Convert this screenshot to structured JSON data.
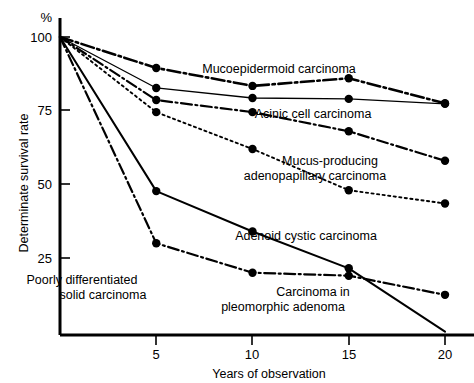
{
  "chart_data": {
    "type": "line",
    "title": "",
    "xlabel": "Years of observation",
    "ylabel": "Determinate survival rate",
    "yunit": "%",
    "xlim": [
      0,
      20
    ],
    "ylim": [
      0,
      100
    ],
    "xticks": [
      5,
      10,
      15,
      20
    ],
    "xticklabels": [
      "5",
      "10",
      "15",
      "20"
    ],
    "yticks": [
      25,
      50,
      75,
      100
    ],
    "yticklabels": [
      "25",
      "50",
      "75",
      "100"
    ],
    "grid": false,
    "legend_position": "inline-annotations",
    "series": [
      {
        "name": "Mucoepidermoid carcinoma",
        "style": "dash-dot-thick",
        "x": [
          0,
          5,
          10,
          15,
          20
        ],
        "values": [
          100,
          89.5,
          83.4,
          86.0,
          77.5
        ]
      },
      {
        "name": "Acinic cell carcinoma",
        "style": "solid-thin",
        "x": [
          0,
          5,
          10,
          15,
          20
        ],
        "values": [
          100,
          82.7,
          79.3,
          79.0,
          77.3
        ]
      },
      {
        "name": "Mucus-producing adenopapillary carcinoma",
        "style": "dash-dot",
        "x": [
          0,
          5,
          10,
          15,
          20
        ],
        "values": [
          100,
          78.6,
          74.5,
          68.0,
          58.0
        ]
      },
      {
        "name": "Adenoid cystic carcinoma",
        "style": "dotted",
        "x": [
          0,
          5,
          10,
          15,
          20
        ],
        "values": [
          100,
          74.5,
          62.0,
          48.0,
          43.5
        ]
      },
      {
        "name": "Poorly differentiated solid carcinoma",
        "style": "solid",
        "x": [
          0,
          5,
          10,
          15,
          20
        ],
        "values": [
          100,
          47.7,
          34.0,
          21.5,
          0.0
        ]
      },
      {
        "name": "Carcinoma in pleomorphic adenoma",
        "style": "dash-dot",
        "x": [
          0,
          5,
          10,
          15,
          20
        ],
        "values": [
          100,
          30.0,
          20.0,
          19.0,
          12.5
        ]
      }
    ],
    "annotations": [
      {
        "text": "Mucoepidermoid carcinoma",
        "x": 279,
        "y": 73
      },
      {
        "text": "Acinic cell carcinoma",
        "x": 313,
        "y": 118
      },
      {
        "text": "Mucus-producing",
        "x": 330,
        "y": 165
      },
      {
        "text": "adenopapillary carcinoma",
        "x": 315,
        "y": 180
      },
      {
        "text": "Adenoid cystic carcinoma",
        "x": 306,
        "y": 240
      },
      {
        "text": "Carcinoma in",
        "x": 313,
        "y": 296
      },
      {
        "text": "pleomorphic adenoma",
        "x": 283,
        "y": 311
      },
      {
        "text": "Poorly differentiated",
        "x": 82,
        "y": 284
      },
      {
        "text": "solid carcinoma",
        "x": 103,
        "y": 299
      }
    ]
  },
  "axes": {
    "y_unit_label": "%",
    "y_title": "Determinate survival rate",
    "x_title": "Years of observation"
  }
}
